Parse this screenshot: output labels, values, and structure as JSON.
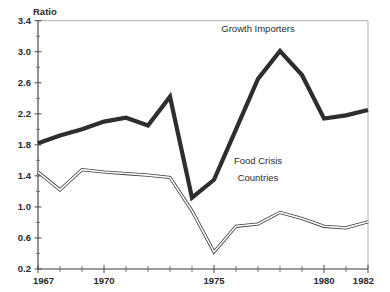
{
  "chart_data": {
    "type": "line",
    "title": "",
    "xlabel": "",
    "ylabel": "Ratio",
    "xlim": [
      1967,
      1982
    ],
    "ylim": [
      0.2,
      3.4
    ],
    "ytick_step": 0.4,
    "yticks": [
      "0.2",
      "0.6",
      "1.0",
      "1.4",
      "1.8",
      "2.2",
      "2.6",
      "3.0",
      "3.4"
    ],
    "ytick_values": [
      0.2,
      0.6,
      1.0,
      1.4,
      1.8,
      2.2,
      2.6,
      3.0,
      3.4
    ],
    "xticks_labeled": [
      "1967",
      "1970",
      "1975",
      "1980",
      "1982"
    ],
    "xtick_values_labeled": [
      1967,
      1970,
      1975,
      1980,
      1982
    ],
    "x": [
      1967,
      1968,
      1969,
      1970,
      1971,
      1972,
      1973,
      1974,
      1975,
      1976,
      1977,
      1978,
      1979,
      1980,
      1981,
      1982
    ],
    "grid": false,
    "legend_position": "inline-annotation",
    "series": [
      {
        "name": "Growth Importers",
        "style": "thick-solid",
        "color": "#2e2e2e",
        "label_x": 1977,
        "label_y": 3.25,
        "values": [
          1.82,
          1.92,
          2.0,
          2.1,
          2.15,
          2.05,
          2.42,
          1.12,
          1.35,
          2.0,
          2.65,
          3.01,
          2.7,
          2.14,
          2.18,
          2.25
        ]
      },
      {
        "name": "Food Crisis Countries",
        "style": "thin-double-outline",
        "color": "#3b3b3b",
        "label_x": 1977,
        "label_y": 1.52,
        "values": [
          1.45,
          1.22,
          1.48,
          1.45,
          1.43,
          1.41,
          1.38,
          0.95,
          0.42,
          0.75,
          0.78,
          0.93,
          0.85,
          0.75,
          0.73,
          0.81
        ]
      }
    ],
    "annotations": [
      {
        "text": "Growth Importers",
        "x": 1977,
        "y": 3.25
      },
      {
        "text": "Food Crisis",
        "x": 1977,
        "y": 1.55
      },
      {
        "text": "Countries",
        "x": 1977,
        "y": 1.33
      }
    ]
  },
  "axis": {
    "y_title": "Ratio"
  }
}
